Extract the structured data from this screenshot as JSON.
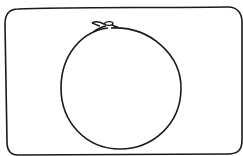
{
  "drawing": {
    "subject": "circle-with-knot-in-rounded-frame",
    "stroke_color": "#1a1a1a",
    "background": "#ffffff",
    "frame": {
      "x": 5,
      "y": 8,
      "width": 236,
      "height": 146,
      "radius": 14
    },
    "circle": {
      "cx": 121,
      "cy": 88,
      "rx": 60,
      "ry": 60
    },
    "knot": {
      "x": 108,
      "y": 24
    }
  }
}
